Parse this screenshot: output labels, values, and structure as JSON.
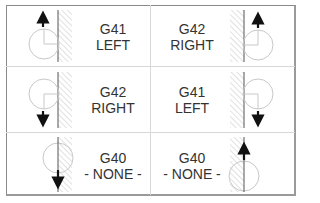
{
  "diagram": {
    "cells": [
      {
        "code": "G41",
        "label": "LEFT",
        "position": "top-left",
        "direction": "up",
        "tool_side": "left-of-wall"
      },
      {
        "code": "G42",
        "label": "RIGHT",
        "position": "top-right",
        "direction": "up",
        "tool_side": "right-of-wall"
      },
      {
        "code": "G42",
        "label": "RIGHT",
        "position": "middle-left",
        "direction": "down",
        "tool_side": "left-of-wall"
      },
      {
        "code": "G41",
        "label": "LEFT",
        "position": "middle-right",
        "direction": "down",
        "tool_side": "right-of-wall"
      },
      {
        "code": "G40",
        "label": "- NONE -",
        "position": "bottom-left",
        "direction": "down",
        "tool_side": "on-wall"
      },
      {
        "code": "G40",
        "label": "- NONE -",
        "position": "bottom-right",
        "direction": "up",
        "tool_side": "on-wall"
      }
    ],
    "colors": {
      "text": "#333333",
      "lines": "#555555",
      "circle": "#c8c8c8",
      "hatch": "#c4c4c4",
      "arrow": "#111111",
      "grid": "#d8d8d8",
      "frame": "#8a8a8a"
    }
  }
}
